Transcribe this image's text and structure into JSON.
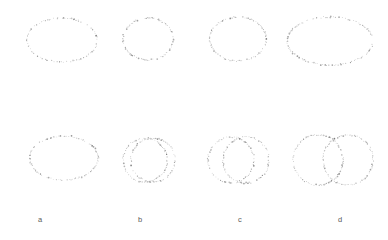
{
  "figure": {
    "type": "scatter-contour-panels",
    "background_color": "#ffffff",
    "point_color": "#9a9a9a",
    "point_color_dark": "#6f6f6f",
    "rows": 2,
    "columns": 4
  },
  "labels": {
    "column_a": "a",
    "column_b": "b",
    "column_c": "c",
    "column_d": "d"
  },
  "label_positions": [
    {
      "text": "a",
      "x": 38,
      "y": 216
    },
    {
      "text": "b",
      "x": 138,
      "y": 216
    },
    {
      "text": "c",
      "x": 238,
      "y": 216
    },
    {
      "text": "d",
      "x": 338,
      "y": 216
    }
  ],
  "chart_data": {
    "type": "scatter",
    "title": "",
    "xlabel": "",
    "ylabel": "",
    "grid": false,
    "legend": null,
    "panels": [
      {
        "id": "top-a",
        "row": 0,
        "col": 0,
        "label": "a",
        "shape": "ellipse",
        "lobes": [
          {
            "cx": 62,
            "cy": 40,
            "rx": 35,
            "ry": 22,
            "arc_start": 0,
            "arc_end": 360
          }
        ],
        "n_points": 120
      },
      {
        "id": "top-b",
        "row": 0,
        "col": 1,
        "label": "b",
        "shape": "ellipse",
        "lobes": [
          {
            "cx": 148,
            "cy": 39,
            "rx": 25,
            "ry": 21,
            "arc_start": 0,
            "arc_end": 360
          }
        ],
        "n_points": 110
      },
      {
        "id": "top-c",
        "row": 0,
        "col": 2,
        "label": "c",
        "shape": "ellipse",
        "lobes": [
          {
            "cx": 238,
            "cy": 39,
            "rx": 28,
            "ry": 22,
            "arc_start": 0,
            "arc_end": 360
          }
        ],
        "n_points": 115
      },
      {
        "id": "top-d",
        "row": 0,
        "col": 3,
        "label": "d",
        "shape": "wide-ellipse-gap",
        "lobes": [
          {
            "cx": 330,
            "cy": 41,
            "rx": 43,
            "ry": 24,
            "arc_start": 8,
            "arc_end": 352
          }
        ],
        "n_points": 150
      },
      {
        "id": "bottom-a",
        "row": 1,
        "col": 0,
        "label": "a",
        "shape": "ellipse",
        "lobes": [
          {
            "cx": 64,
            "cy": 158,
            "rx": 34,
            "ry": 22,
            "arc_start": 0,
            "arc_end": 360
          }
        ],
        "n_points": 120
      },
      {
        "id": "bottom-b",
        "row": 1,
        "col": 1,
        "label": "b",
        "shape": "two-overlapping-circles",
        "lobes": [
          {
            "cx": 145,
            "cy": 160,
            "r": 22,
            "arc_start": 0,
            "arc_end": 360
          },
          {
            "cx": 153,
            "cy": 160,
            "r": 22,
            "arc_start": 0,
            "arc_end": 360
          }
        ],
        "n_points": 100
      },
      {
        "id": "bottom-c",
        "row": 1,
        "col": 2,
        "label": "c",
        "shape": "two-overlapping-circles",
        "lobes": [
          {
            "cx": 231,
            "cy": 160,
            "r": 23,
            "arc_start": 0,
            "arc_end": 360
          },
          {
            "cx": 246,
            "cy": 160,
            "r": 23,
            "arc_start": 0,
            "arc_end": 360
          }
        ],
        "n_points": 105
      },
      {
        "id": "bottom-d",
        "row": 1,
        "col": 3,
        "label": "d",
        "shape": "two-tangent-circles",
        "lobes": [
          {
            "cx": 318,
            "cy": 160,
            "r": 25,
            "arc_start": 0,
            "arc_end": 360
          },
          {
            "cx": 348,
            "cy": 160,
            "r": 25,
            "arc_start": 0,
            "arc_end": 360
          }
        ],
        "n_points": 115
      }
    ]
  }
}
